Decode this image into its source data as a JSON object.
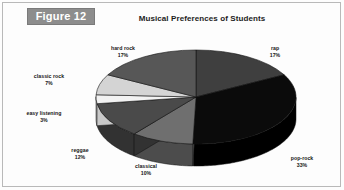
{
  "figure": {
    "badge_label": "Figure 12",
    "badge_bg_color": "#8d8d8d",
    "badge_text_color": "#ffffff",
    "frame_color": "#b9b9b9",
    "background_color": "#fdfdfd"
  },
  "chart_data": {
    "type": "pie",
    "title": "Musical Preferences of Students",
    "xlabel": "",
    "ylabel": "",
    "grid": false,
    "legend_position": "none",
    "label_format": "name + percent",
    "three_d": true,
    "start_angle_deg": 0,
    "direction": "clockwise",
    "categories": [
      "rap",
      "pop-rock",
      "classical",
      "reggae",
      "easy listening",
      "classic rock",
      "hard rock"
    ],
    "values": [
      17,
      33,
      10,
      12,
      3,
      7,
      17
    ],
    "value_labels": [
      "17%",
      "33%",
      "10%",
      "12%",
      "3%",
      "7%",
      "17%"
    ],
    "colors": [
      "#3f3f3f",
      "#0b0b0b",
      "#6f6f6f",
      "#4a4a4a",
      "#f2f2f2",
      "#d4d4d4",
      "#575757"
    ],
    "side_colors": [
      "#2a2a2a",
      "#000000",
      "#4c4c4c",
      "#323232",
      "#c9c9c9",
      "#a8a8a8",
      "#3b3b3b"
    ],
    "slices": [
      {
        "name": "rap",
        "percent": 17,
        "label": "rap",
        "pct_label": "17%",
        "color": "#3f3f3f",
        "side_color": "#2a2a2a"
      },
      {
        "name": "pop-rock",
        "percent": 33,
        "label": "pop-rock",
        "pct_label": "33%",
        "color": "#0b0b0b",
        "side_color": "#000000"
      },
      {
        "name": "classical",
        "percent": 10,
        "label": "classical",
        "pct_label": "10%",
        "color": "#6f6f6f",
        "side_color": "#4c4c4c"
      },
      {
        "name": "reggae",
        "percent": 12,
        "label": "reggae",
        "pct_label": "12%",
        "color": "#4a4a4a",
        "side_color": "#323232"
      },
      {
        "name": "easy listening",
        "percent": 3,
        "label": "easy listening",
        "pct_label": "3%",
        "color": "#f2f2f2",
        "side_color": "#c9c9c9"
      },
      {
        "name": "classic rock",
        "percent": 7,
        "label": "classic rock",
        "pct_label": "7%",
        "color": "#d4d4d4",
        "side_color": "#a8a8a8"
      },
      {
        "name": "hard rock",
        "percent": 17,
        "label": "hard rock",
        "pct_label": "17%",
        "color": "#575757",
        "side_color": "#3b3b3b"
      }
    ]
  }
}
